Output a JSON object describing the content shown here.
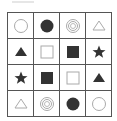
{
  "puzzle": {
    "rows": 4,
    "cols": 4,
    "colors": {
      "dark": "#333333",
      "light": "#aaaaaa",
      "grid": "#555555"
    },
    "cells": [
      [
        "circle-outline",
        "circle-filled",
        "double-circle",
        "triangle-outline"
      ],
      [
        "triangle-filled",
        "square-outline",
        "square-filled",
        "star-filled"
      ],
      [
        "star-filled",
        "square-filled",
        "square-outline",
        "triangle-filled"
      ],
      [
        "triangle-outline",
        "double-circle",
        "circle-filled",
        "circle-outline"
      ]
    ]
  }
}
